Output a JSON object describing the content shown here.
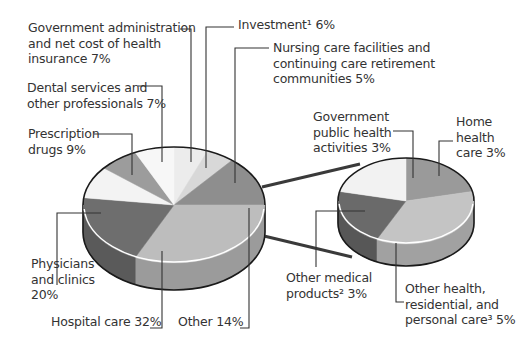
{
  "chart_data": {
    "type": "pie",
    "title": "",
    "style": "3d-pie-of-pie",
    "main_pie": {
      "slices": [
        {
          "label": "Investment¹",
          "value": 6,
          "color": "#ececec"
        },
        {
          "label": "Nursing care facilities and continuing care retirement communities",
          "value": 5,
          "color": "#d8d8d8"
        },
        {
          "label": "Other",
          "value": 14,
          "color": "#8e8e8e"
        },
        {
          "label": "Hospital care",
          "value": 32,
          "color": "#bdbdbd"
        },
        {
          "label": "Physicians and clinics",
          "value": 20,
          "color": "#6e6e6e"
        },
        {
          "label": "Prescription drugs",
          "value": 9,
          "color": "#f3f3f3"
        },
        {
          "label": "Dental services and other professionals",
          "value": 7,
          "color": "#9c9c9c"
        },
        {
          "label": "Government administration and net cost of health insurance",
          "value": 7,
          "color": "#f7f7f7"
        }
      ]
    },
    "other_breakdown": {
      "parent": "Other",
      "total": 14,
      "slices": [
        {
          "label": "Home health care",
          "value": 3,
          "color": "#9a9a9a"
        },
        {
          "label": "Other health, residential, and personal care³",
          "value": 5,
          "color": "#c4c4c4"
        },
        {
          "label": "Other medical products²",
          "value": 3,
          "color": "#6a6a6a"
        },
        {
          "label": "Government public health activities",
          "value": 3,
          "color": "#f2f2f2"
        }
      ]
    }
  },
  "labels": {
    "gov_admin": [
      "Government administration",
      "and net cost of health",
      "insurance 7%"
    ],
    "investment": [
      "Investment¹ 6%"
    ],
    "nursing": [
      "Nursing care facilities and",
      "continuing care retirement",
      "communities 5%"
    ],
    "dental": [
      "Dental services and",
      "other professionals 7%"
    ],
    "prescription": [
      "Prescription",
      "drugs 9%"
    ],
    "physicians": [
      "Physicians",
      "and clinics",
      "20%"
    ],
    "hospital": [
      "Hospital care 32%"
    ],
    "other": [
      "Other 14%"
    ],
    "gov_public": [
      "Government",
      "public health",
      "activities 3%"
    ],
    "home_health": [
      "Home",
      "health",
      "care 3%"
    ],
    "other_medical": [
      "Other medical",
      "products² 3%"
    ],
    "other_health": [
      "Other health,",
      "residential, and",
      "personal care³ 5%"
    ]
  }
}
